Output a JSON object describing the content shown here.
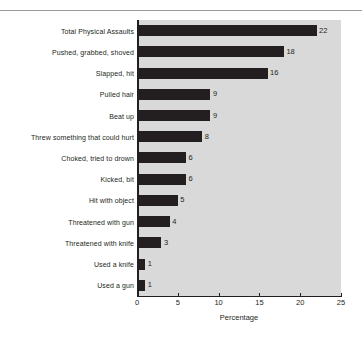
{
  "chart_data": {
    "type": "bar",
    "orientation": "horizontal",
    "title": "",
    "xlabel": "Percentage",
    "ylabel": "",
    "xlim": [
      0,
      25
    ],
    "xticks": [
      0,
      5,
      10,
      15,
      20,
      25
    ],
    "xtick_labels": [
      "0",
      "5",
      "10",
      "15",
      "20",
      "25"
    ],
    "grid": false,
    "legend": null,
    "bar_color": "#231f20",
    "plot_background": "#d9d9d9",
    "figure_background": "#ffffff",
    "value_labels_shown": true,
    "categories": [
      "Total Physical Assaults",
      "Pushed, grabbed, shoved",
      "Slapped, hit",
      "Pulled hair",
      "Beat up",
      "Threw something that could hurt",
      "Choked, tried to drown",
      "Kicked, bit",
      "Hit with object",
      "Threatened with gun",
      "Threatened with knife",
      "Used a knife",
      "Used a gun"
    ],
    "values": [
      22,
      18,
      16,
      9,
      9,
      8,
      6,
      6,
      5,
      4,
      3,
      1,
      1
    ],
    "value_label_text": [
      "22",
      "18",
      "16",
      "9",
      "9",
      "8",
      "6",
      "6",
      "5",
      "4",
      "3",
      "1",
      "1"
    ]
  }
}
